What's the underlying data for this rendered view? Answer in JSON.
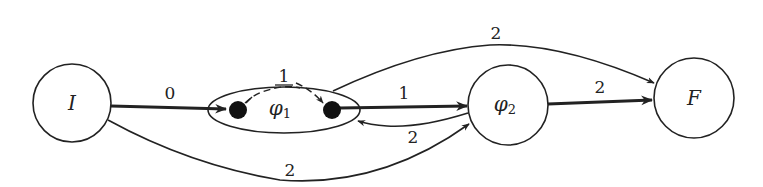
{
  "diagram": {
    "type": "weighted directed graph / automaton",
    "colors": {
      "stroke": "#222222",
      "fill": "#ffffff",
      "dot": "#111111"
    },
    "nodes": [
      {
        "id": "I",
        "label": "I",
        "shape": "circle"
      },
      {
        "id": "phi1",
        "label": "φ",
        "subscript": "1",
        "shape": "ellipse",
        "contains": [
          "phi1_in",
          "phi1_out"
        ]
      },
      {
        "id": "phi2",
        "label": "φ",
        "subscript": "2",
        "shape": "circle"
      },
      {
        "id": "F",
        "label": "F",
        "shape": "circle"
      }
    ],
    "inner_states": [
      {
        "id": "phi1_in",
        "shape": "filled-dot"
      },
      {
        "id": "phi1_out",
        "shape": "filled-dot"
      }
    ],
    "edges": [
      {
        "from": "I",
        "to": "phi1_in",
        "weight": "0",
        "style": "thick"
      },
      {
        "from": "phi1_in",
        "to": "phi1_out",
        "weight": "1",
        "style": "dashed-arc"
      },
      {
        "from": "phi1_out",
        "to": "phi2",
        "weight": "1",
        "style": "thick"
      },
      {
        "from": "phi2",
        "to": "phi1",
        "weight": "2",
        "style": "thin-curved"
      },
      {
        "from": "phi1",
        "to": "F",
        "weight": "2",
        "style": "thin-curved"
      },
      {
        "from": "phi2",
        "to": "F",
        "weight": "2",
        "style": "thick"
      },
      {
        "from": "I",
        "to": "phi2",
        "weight": "2",
        "style": "thin-curved"
      }
    ]
  }
}
